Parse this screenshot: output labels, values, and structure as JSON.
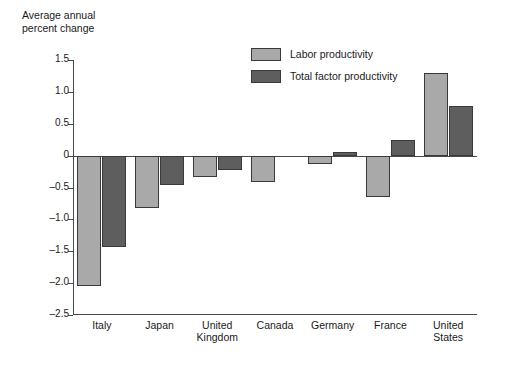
{
  "chart_data": {
    "type": "bar",
    "title": "Average annual\npercent change",
    "xlabel": "",
    "ylabel": "Average annual percent change",
    "ylim": [
      -2.5,
      1.5
    ],
    "ytick_labels": [
      "1.5",
      "1.0",
      "0.5",
      "0",
      "-0.5",
      "-1.0",
      "-1.5",
      "-2.0",
      "-2.5"
    ],
    "ytick_values": [
      1.5,
      1.0,
      0.5,
      0,
      -0.5,
      -1.0,
      -1.5,
      -2.0,
      -2.5
    ],
    "grid": false,
    "legend_position": "top-center-right",
    "categories": [
      "Italy",
      "Japan",
      "United\nKingdom",
      "Canada",
      "Germany",
      "France",
      "United\nStates"
    ],
    "series": [
      {
        "name": "Labor productivity",
        "color": "#a9a9a9",
        "values": [
          -2.05,
          -0.82,
          -0.33,
          -0.42,
          -0.13,
          -0.65,
          1.3
        ]
      },
      {
        "name": "Total factor productivity",
        "color": "#5e5e5e",
        "values": [
          -1.44,
          -0.46,
          -0.22,
          0,
          0.06,
          0.25,
          0.78
        ]
      }
    ]
  },
  "legend": {
    "items": [
      {
        "label": "Labor productivity",
        "color": "#a9a9a9"
      },
      {
        "label": "Total factor productivity",
        "color": "#5e5e5e"
      }
    ]
  },
  "axis": {
    "zero_label": "0",
    "line_color": "#4a4a4a"
  }
}
